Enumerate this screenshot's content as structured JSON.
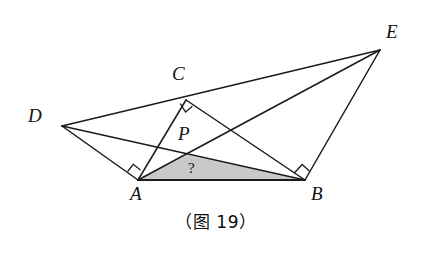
{
  "figure": {
    "caption": "（图 19）",
    "background_color": "#ffffff",
    "stroke_color": "#1a1a1a",
    "shaded_fill_color": "#c9c9c9",
    "points": {
      "A": {
        "label": "A",
        "x": 138,
        "y": 180,
        "label_x": 130,
        "label_y": 184
      },
      "B": {
        "label": "B",
        "x": 305,
        "y": 180,
        "label_x": 311,
        "label_y": 184
      },
      "C": {
        "label": "C",
        "x": 186,
        "y": 100,
        "label_x": 172,
        "label_y": 64
      },
      "D": {
        "label": "D",
        "x": 62,
        "y": 126,
        "label_x": 28,
        "label_y": 106
      },
      "E": {
        "label": "E",
        "x": 380,
        "y": 50,
        "label_x": 386,
        "label_y": 22
      },
      "P": {
        "label": "P",
        "x": 187,
        "y": 155,
        "label_x": 178,
        "label_y": 124
      }
    },
    "segments": [
      {
        "name": "D-E",
        "from": "D",
        "to": "E"
      },
      {
        "name": "D-A",
        "from": "D",
        "to": "A"
      },
      {
        "name": "D-B",
        "from": "D",
        "to": "B"
      },
      {
        "name": "A-C",
        "from": "A",
        "to": "C"
      },
      {
        "name": "A-E",
        "from": "A",
        "to": "E"
      },
      {
        "name": "C-B",
        "from": "C",
        "to": "B"
      },
      {
        "name": "B-E",
        "from": "B",
        "to": "E"
      },
      {
        "name": "A-B",
        "from": "A",
        "to": "B"
      }
    ],
    "right_angles": [
      {
        "name": "right-angle-at-A",
        "vertex": "A"
      },
      {
        "name": "right-angle-at-B",
        "vertex": "B"
      },
      {
        "name": "right-angle-at-C",
        "vertex": "C"
      }
    ],
    "shaded_region": {
      "name": "triangle-APB",
      "vertices": [
        "A",
        "P",
        "B"
      ],
      "marker": "?",
      "marker_x": 188,
      "marker_y": 161
    }
  }
}
